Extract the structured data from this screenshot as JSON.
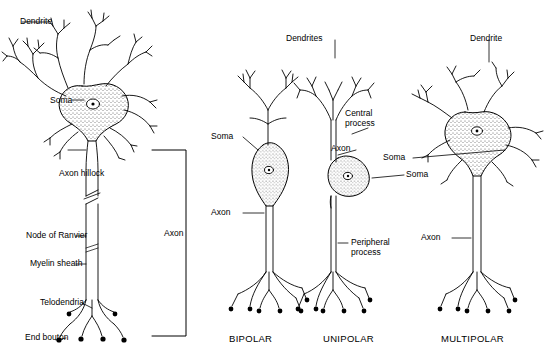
{
  "figure": {
    "background": "#ffffff",
    "stroke": "#000000",
    "soma_fill": "stippled-gray"
  },
  "panels": [
    {
      "id": "multipolar-detail",
      "type_label": "",
      "labels": [
        {
          "key": "dendrite",
          "text": "Dendrite"
        },
        {
          "key": "soma",
          "text": "Soma"
        },
        {
          "key": "axon_hillock",
          "text": "Axon hillock"
        },
        {
          "key": "node_of_ranvier",
          "text": "Node of Ranvier"
        },
        {
          "key": "myelin_sheath",
          "text": "Myelin sheath"
        },
        {
          "key": "telodendria",
          "text": "Telodendria"
        },
        {
          "key": "end_bouton",
          "text": "End bouton"
        },
        {
          "key": "axon_bracket",
          "text": "Axon"
        }
      ]
    },
    {
      "id": "bipolar",
      "type_label": "BIPOLAR",
      "labels": [
        {
          "key": "soma",
          "text": "Soma"
        },
        {
          "key": "axon",
          "text": "Axon"
        }
      ]
    },
    {
      "id": "unipolar",
      "type_label": "UNIPOLAR",
      "labels": [
        {
          "key": "dendrites",
          "text": "Dendrites"
        },
        {
          "key": "central_process",
          "text": "Central\nprocess"
        },
        {
          "key": "axon",
          "text": "Axon"
        },
        {
          "key": "soma",
          "text": "Soma"
        },
        {
          "key": "peripheral_process",
          "text": "Peripheral\nprocess"
        }
      ]
    },
    {
      "id": "multipolar",
      "type_label": "MULTIPOLAR",
      "labels": [
        {
          "key": "dendrite",
          "text": "Dendrite"
        },
        {
          "key": "soma",
          "text": "Soma"
        },
        {
          "key": "axon",
          "text": "Axon"
        }
      ]
    }
  ],
  "text": {
    "dendrite_1": "Dendrite",
    "soma_1": "Soma",
    "axon_hillock": "Axon hillock",
    "node_of_ranvier": "Node of Ranvier",
    "myelin_sheath": "Myelin sheath",
    "telodendria": "Telodendria",
    "end_bouton": "End bouton",
    "axon_bracket": "Axon",
    "soma_bi": "Soma",
    "axon_bi": "Axon",
    "bipolar": "BIPOLAR",
    "dendrites_uni": "Dendrites",
    "central_process": "Central\nprocess",
    "axon_uni": "Axon",
    "soma_uni": "Soma",
    "peripheral_process": "Peripheral\nprocess",
    "unipolar": "UNIPOLAR",
    "dendrite_multi": "Dendrite",
    "soma_multi": "Soma",
    "axon_multi": "Axon",
    "multipolar": "MULTIPOLAR"
  }
}
